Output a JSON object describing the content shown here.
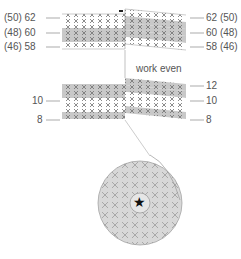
{
  "diagram": {
    "type": "crochet-stitch-chart",
    "colors": {
      "shaded_row": "#c8c8c8",
      "plain_row": "#ffffff",
      "stitch": "#707070",
      "line": "#999999",
      "text": "#555555",
      "circle_fill": "#d8d8d8"
    },
    "top_block": {
      "left_labels": [
        "(50) 62",
        "(48) 60",
        "(46) 58"
      ],
      "right_labels": [
        "62 (50)",
        "60 (48)",
        "58 (46)"
      ]
    },
    "note": "work even",
    "bottom_block": {
      "left_labels": [
        "10",
        "8"
      ],
      "right_labels": [
        "12",
        "10",
        "8"
      ]
    },
    "center_symbol": "★"
  }
}
